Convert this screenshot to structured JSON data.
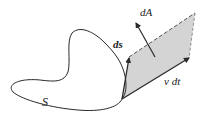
{
  "diagram": {
    "labels": {
      "surface": "S",
      "line_element": "ds",
      "area_element": "dA",
      "velocity_displacement": "v dt"
    },
    "colors": {
      "stroke": "#2a2a2a",
      "parallelogram_fill": "#d4d4d4",
      "background": "#ffffff"
    }
  }
}
